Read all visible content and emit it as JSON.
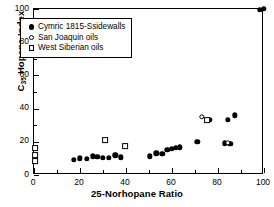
{
  "chart_data": {
    "type": "scatter",
    "title": "",
    "xlabel": "25-Norhopane Ratio",
    "ylabel_text": "C35 Hopane Index",
    "ylabel_prefix": "C",
    "ylabel_subscript": "35",
    "ylabel_suffix": " Hopane Index",
    "xlim": [
      0,
      100
    ],
    "ylim": [
      0,
      100
    ],
    "xticks": [
      0,
      20,
      40,
      60,
      80,
      100
    ],
    "yticks": [
      0,
      20,
      40,
      60,
      80,
      100
    ],
    "xtick_labels": [
      "0",
      "20",
      "40",
      "60",
      "80",
      "100"
    ],
    "ytick_labels": [
      "0",
      "20",
      "40",
      "60",
      "80",
      "100"
    ],
    "grid": false,
    "legend_position": "upper-left",
    "marker_colors": {
      "fill": "#000000",
      "open": "#ffffff",
      "edge": "#000000"
    },
    "series": [
      {
        "name": "Cymric 1815-Ssidewalls",
        "marker": "filled-circle",
        "points": [
          [
            17.2,
            9.0
          ],
          [
            19.8,
            10.0
          ],
          [
            22.9,
            9.8
          ],
          [
            25.6,
            11.2
          ],
          [
            27.6,
            11.0
          ],
          [
            29.9,
            10.2
          ],
          [
            32.6,
            10.4
          ],
          [
            35.4,
            11.8
          ],
          [
            37.8,
            10.6
          ],
          [
            50.4,
            11.2
          ],
          [
            53.2,
            13.0
          ],
          [
            55.8,
            12.6
          ],
          [
            57.9,
            15.0
          ],
          [
            59.9,
            15.8
          ],
          [
            61.6,
            16.2
          ],
          [
            63.3,
            16.8
          ],
          [
            71.0,
            20.0
          ],
          [
            76.2,
            33.2
          ],
          [
            83.0,
            19.2
          ],
          [
            85.4,
            18.8
          ],
          [
            84.2,
            33.4
          ],
          [
            87.2,
            36.0
          ],
          [
            98.3,
            99.6
          ],
          [
            100.0,
            100.0
          ]
        ]
      },
      {
        "name": "San Joaquin oils",
        "marker": "open-circle",
        "points": [
          [
            73.0,
            35.2
          ],
          [
            84.2,
            19.4
          ]
        ]
      },
      {
        "name": "West Siberian oils",
        "marker": "open-square",
        "points": [
          [
            0.4,
            16.0
          ],
          [
            0.4,
            12.2
          ],
          [
            0.4,
            8.4
          ],
          [
            30.8,
            21.0
          ],
          [
            39.6,
            17.2
          ],
          [
            75.2,
            33.0
          ]
        ]
      }
    ]
  },
  "legend": {
    "items": [
      {
        "label": "Cymric 1815-Ssidewalls",
        "marker": "filled-circle"
      },
      {
        "label": "San Joaquin oils",
        "marker": "open-circle"
      },
      {
        "label": "West Siberian oils",
        "marker": "open-square"
      }
    ]
  }
}
